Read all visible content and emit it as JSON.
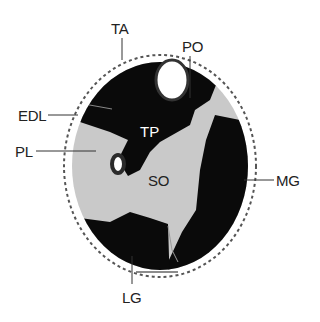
{
  "figure": {
    "type": "cross-sectional anatomical diagram (lower leg muscles)",
    "colors": {
      "background": "#ffffff",
      "muscle_dark": "#0a0a0a",
      "soleus_gray": "#c9c9c9",
      "bone_white": "#ffffff",
      "outline": "#444444",
      "label_text": "#222222",
      "leader_line": "#333333",
      "tp_label": "#ffffff"
    },
    "labels": {
      "ta": "TA",
      "po": "PO",
      "edl": "EDL",
      "pl": "PL",
      "tp": "TP",
      "so": "SO",
      "mg": "MG",
      "lg": "LG"
    }
  }
}
